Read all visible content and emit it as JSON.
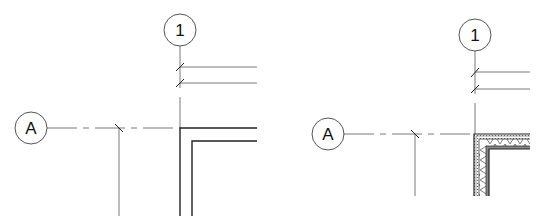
{
  "diagram": {
    "type": "architectural-plan-detail",
    "panels": [
      {
        "id": "left",
        "description": "Grid intersection with simple wall corner (two-line wall)",
        "grid_bubbles": [
          {
            "label": "1",
            "orientation": "vertical"
          },
          {
            "label": "A",
            "orientation": "horizontal"
          }
        ],
        "wall_style": "simple"
      },
      {
        "id": "right",
        "description": "Grid intersection with hatched/insulated wall corner",
        "grid_bubbles": [
          {
            "label": "1",
            "orientation": "vertical"
          },
          {
            "label": "A",
            "orientation": "horizontal"
          }
        ],
        "wall_style": "hatched-insulation"
      }
    ],
    "colors": {
      "line": "#333333",
      "background": "#ffffff"
    }
  },
  "left": {
    "grid_1_label": "1",
    "grid_a_label": "A"
  },
  "right": {
    "grid_1_label": "1",
    "grid_a_label": "A"
  }
}
